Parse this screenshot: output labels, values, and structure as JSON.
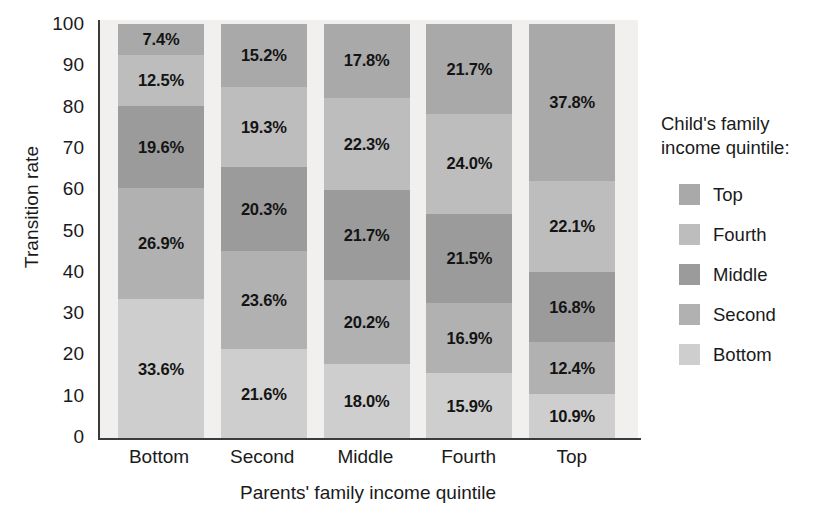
{
  "chart_data": {
    "type": "bar",
    "subtype": "stacked-bar-100-percent",
    "title": "",
    "xlabel": "Parents' family income quintile",
    "ylabel": "Transition rate",
    "categories": [
      "Bottom",
      "Second",
      "Middle",
      "Fourth",
      "Top"
    ],
    "ylim": [
      0,
      100
    ],
    "yticks": [
      0,
      10,
      20,
      30,
      40,
      50,
      60,
      70,
      80,
      90,
      100
    ],
    "grid": false,
    "legend_position": "right",
    "legend_title": "Child's family income quintile:",
    "stack_order_bottom_to_top": [
      "Bottom",
      "Second",
      "Middle",
      "Fourth",
      "Top"
    ],
    "series": [
      {
        "name": "Top",
        "color": "#a9a9a9",
        "values": [
          7.4,
          15.2,
          17.8,
          21.7,
          37.8
        ]
      },
      {
        "name": "Fourth",
        "color": "#bdbdbd",
        "values": [
          12.5,
          19.3,
          22.3,
          24.0,
          22.1
        ]
      },
      {
        "name": "Middle",
        "color": "#9b9b9b",
        "values": [
          19.6,
          20.3,
          21.7,
          21.5,
          16.8
        ]
      },
      {
        "name": "Second",
        "color": "#b1b1b1",
        "values": [
          26.9,
          23.6,
          20.2,
          16.9,
          12.4
        ]
      },
      {
        "name": "Bottom",
        "color": "#cecece",
        "values": [
          33.6,
          21.6,
          18.0,
          15.9,
          10.9
        ]
      }
    ],
    "data_labels": [
      {
        "category": "Bottom",
        "segments": [
          {
            "series": "Top",
            "label": "7.4%",
            "value": 7.4
          },
          {
            "series": "Fourth",
            "label": "12.5%",
            "value": 12.5
          },
          {
            "series": "Middle",
            "label": "19.6%",
            "value": 19.6
          },
          {
            "series": "Second",
            "label": "26.9%",
            "value": 26.9
          },
          {
            "series": "Bottom",
            "label": "33.6%",
            "value": 33.6
          }
        ]
      },
      {
        "category": "Second",
        "segments": [
          {
            "series": "Top",
            "label": "15.2%",
            "value": 15.2
          },
          {
            "series": "Fourth",
            "label": "19.3%",
            "value": 19.3
          },
          {
            "series": "Middle",
            "label": "20.3%",
            "value": 20.3
          },
          {
            "series": "Second",
            "label": "23.6%",
            "value": 23.6
          },
          {
            "series": "Bottom",
            "label": "21.6%",
            "value": 21.6
          }
        ]
      },
      {
        "category": "Middle",
        "segments": [
          {
            "series": "Top",
            "label": "17.8%",
            "value": 17.8
          },
          {
            "series": "Fourth",
            "label": "22.3%",
            "value": 22.3
          },
          {
            "series": "Middle",
            "label": "21.7%",
            "value": 21.7
          },
          {
            "series": "Second",
            "label": "20.2%",
            "value": 20.2
          },
          {
            "series": "Bottom",
            "label": "18.0%",
            "value": 18.0
          }
        ]
      },
      {
        "category": "Fourth",
        "segments": [
          {
            "series": "Top",
            "label": "21.7%",
            "value": 21.7
          },
          {
            "series": "Fourth",
            "label": "24.0%",
            "value": 24.0
          },
          {
            "series": "Middle",
            "label": "21.5%",
            "value": 21.5
          },
          {
            "series": "Second",
            "label": "16.9%",
            "value": 16.9
          },
          {
            "series": "Bottom",
            "label": "15.9%",
            "value": 15.9
          }
        ]
      },
      {
        "category": "Top",
        "segments": [
          {
            "series": "Top",
            "label": "37.8%",
            "value": 37.8
          },
          {
            "series": "Fourth",
            "label": "22.1%",
            "value": 22.1
          },
          {
            "series": "Middle",
            "label": "16.8%",
            "value": 16.8
          },
          {
            "series": "Second",
            "label": "12.4%",
            "value": 12.4
          },
          {
            "series": "Bottom",
            "label": "10.9%",
            "value": 10.9
          }
        ]
      }
    ]
  },
  "axes": {
    "y_title": "Transition rate",
    "x_title": "Parents' family income quintile",
    "y_ticks": [
      "100",
      "90",
      "80",
      "70",
      "60",
      "50",
      "40",
      "30",
      "20",
      "10",
      "0"
    ],
    "x_ticks": [
      "Bottom",
      "Second",
      "Middle",
      "Fourth",
      "Top"
    ]
  },
  "legend": {
    "title": "Child's family income quintile:",
    "items": [
      {
        "label": "Top",
        "color": "#a9a9a9"
      },
      {
        "label": "Fourth",
        "color": "#bdbdbd"
      },
      {
        "label": "Middle",
        "color": "#9b9b9b"
      },
      {
        "label": "Second",
        "color": "#b1b1b1"
      },
      {
        "label": "Bottom",
        "color": "#cecece"
      }
    ]
  },
  "style": {
    "plot_background": "#f1f0ee",
    "axis_color": "#3b3b3b",
    "text_color": "#1a1a1a",
    "page_background": "#ffffff"
  }
}
